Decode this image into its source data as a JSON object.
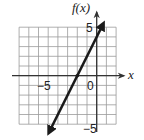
{
  "chart_data": {
    "type": "line",
    "title": "",
    "xlabel": "x",
    "ylabel": "f(x)",
    "xlim": [
      -8,
      2
    ],
    "ylim": [
      -5,
      5
    ],
    "grid": true,
    "x_tick_labels": [
      "-5"
    ],
    "y_tick_labels": [
      "5",
      "-5"
    ],
    "origin_label": "0",
    "series": [
      {
        "name": "f(x)",
        "equation": "f(x) = 2x + 4",
        "slope": 2,
        "intercept": 4,
        "x": [
          -4.5,
          -2,
          0,
          0.5
        ],
        "y": [
          -5,
          0,
          4,
          5
        ],
        "arrows": "both ends"
      }
    ],
    "points": [
      {
        "x": -2,
        "y": 0
      }
    ]
  },
  "labels": {
    "y_axis": "f(x)",
    "x_axis": "x",
    "x_neg5": "−5",
    "origin": "0",
    "y_pos5": "5",
    "y_neg5": "−5"
  },
  "colors": {
    "line": "#1a1a1a",
    "grid": "#9a9a9a",
    "axis": "#333333"
  }
}
